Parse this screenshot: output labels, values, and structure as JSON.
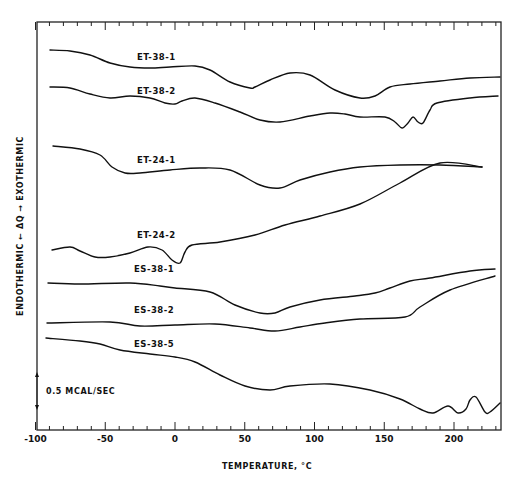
{
  "chart_data": {
    "type": "line",
    "title": "",
    "xlabel": "TEMPERATURE, °C",
    "ylabel": "ENDOTHERMIC ← ΔQ → EXOTHERMIC",
    "xlim": [
      -100,
      230
    ],
    "x_ticks": [
      -100,
      -50,
      0,
      50,
      100,
      150,
      200
    ],
    "x_minor_tick_step": 10,
    "grid": false,
    "scale_bar": {
      "label": "0.5 MCAL/SEC",
      "x": 37,
      "y1": 372,
      "y2": 410
    },
    "plot_px": {
      "left": 37,
      "right": 501,
      "top": 22,
      "bottom": 430,
      "x0_px": 175,
      "px_per_deg": 1.395
    },
    "series": [
      {
        "name": "ET-38-1",
        "label_pos": [
          137,
          60
        ],
        "points": [
          [
            50,
            50
          ],
          [
            70,
            51
          ],
          [
            90,
            55
          ],
          [
            110,
            63
          ],
          [
            130,
            67
          ],
          [
            150,
            68
          ],
          [
            170,
            67
          ],
          [
            195,
            66
          ],
          [
            210,
            70
          ],
          [
            230,
            82
          ],
          [
            250,
            88
          ],
          [
            255,
            87
          ],
          [
            270,
            80
          ],
          [
            290,
            73
          ],
          [
            310,
            75
          ],
          [
            335,
            90
          ],
          [
            360,
            98
          ],
          [
            375,
            96
          ],
          [
            390,
            87
          ],
          [
            410,
            84
          ],
          [
            440,
            81
          ],
          [
            470,
            78
          ],
          [
            500,
            77
          ]
        ]
      },
      {
        "name": "ET-38-2",
        "label_pos": [
          137,
          94
        ],
        "points": [
          [
            50,
            87
          ],
          [
            70,
            88
          ],
          [
            90,
            94
          ],
          [
            110,
            98
          ],
          [
            130,
            96
          ],
          [
            150,
            98
          ],
          [
            165,
            103
          ],
          [
            175,
            104
          ],
          [
            182,
            101
          ],
          [
            195,
            98
          ],
          [
            215,
            103
          ],
          [
            240,
            112
          ],
          [
            260,
            120
          ],
          [
            280,
            122
          ],
          [
            310,
            116
          ],
          [
            330,
            113
          ],
          [
            345,
            114
          ],
          [
            360,
            117
          ],
          [
            385,
            117
          ],
          [
            395,
            122
          ],
          [
            402,
            128
          ],
          [
            408,
            123
          ],
          [
            413,
            117
          ],
          [
            418,
            122
          ],
          [
            423,
            123
          ],
          [
            430,
            110
          ],
          [
            437,
            103
          ],
          [
            470,
            98
          ],
          [
            498,
            96
          ]
        ]
      },
      {
        "name": "ET-24-1",
        "label_pos": [
          137,
          163
        ],
        "points": [
          [
            53,
            146
          ],
          [
            80,
            149
          ],
          [
            100,
            155
          ],
          [
            112,
            167
          ],
          [
            125,
            173
          ],
          [
            140,
            173
          ],
          [
            170,
            170
          ],
          [
            200,
            168
          ],
          [
            230,
            170
          ],
          [
            260,
            185
          ],
          [
            280,
            188
          ],
          [
            300,
            180
          ],
          [
            330,
            172
          ],
          [
            360,
            167
          ],
          [
            400,
            165
          ],
          [
            440,
            165
          ],
          [
            482,
            167
          ]
        ]
      },
      {
        "name": "ET-24-2",
        "label_pos": [
          137,
          238
        ],
        "points": [
          [
            52,
            250
          ],
          [
            70,
            247
          ],
          [
            80,
            251
          ],
          [
            95,
            257
          ],
          [
            110,
            257
          ],
          [
            130,
            253
          ],
          [
            148,
            247
          ],
          [
            162,
            250
          ],
          [
            172,
            260
          ],
          [
            180,
            263
          ],
          [
            185,
            252
          ],
          [
            192,
            245
          ],
          [
            220,
            242
          ],
          [
            255,
            235
          ],
          [
            285,
            225
          ],
          [
            320,
            216
          ],
          [
            360,
            204
          ],
          [
            400,
            183
          ],
          [
            440,
            163
          ],
          [
            482,
            167
          ]
        ]
      },
      {
        "name": "ES-38-1",
        "label_pos": [
          134,
          272
        ],
        "points": [
          [
            48,
            283
          ],
          [
            80,
            284
          ],
          [
            130,
            283
          ],
          [
            160,
            286
          ],
          [
            175,
            288
          ],
          [
            210,
            292
          ],
          [
            235,
            305
          ],
          [
            260,
            313
          ],
          [
            275,
            313
          ],
          [
            290,
            307
          ],
          [
            320,
            300
          ],
          [
            355,
            296
          ],
          [
            375,
            293
          ],
          [
            390,
            288
          ],
          [
            410,
            281
          ],
          [
            430,
            278
          ],
          [
            470,
            271
          ],
          [
            495,
            269
          ]
        ]
      },
      {
        "name": "ES-38-2",
        "label_pos": [
          134,
          313
        ],
        "points": [
          [
            47,
            323
          ],
          [
            110,
            322
          ],
          [
            140,
            326
          ],
          [
            175,
            325
          ],
          [
            215,
            324
          ],
          [
            250,
            328
          ],
          [
            275,
            331
          ],
          [
            300,
            327
          ],
          [
            325,
            323
          ],
          [
            360,
            319
          ],
          [
            405,
            317
          ],
          [
            420,
            307
          ],
          [
            450,
            290
          ],
          [
            495,
            276
          ]
        ]
      },
      {
        "name": "ES-38-5",
        "label_pos": [
          134,
          347
        ],
        "points": [
          [
            46,
            338
          ],
          [
            80,
            341
          ],
          [
            100,
            344
          ],
          [
            120,
            350
          ],
          [
            150,
            354
          ],
          [
            175,
            357
          ],
          [
            195,
            362
          ],
          [
            220,
            375
          ],
          [
            245,
            386
          ],
          [
            270,
            390
          ],
          [
            290,
            386
          ],
          [
            330,
            384
          ],
          [
            370,
            390
          ],
          [
            400,
            399
          ],
          [
            420,
            409
          ],
          [
            433,
            413
          ],
          [
            448,
            406
          ],
          [
            458,
            413
          ],
          [
            466,
            409
          ],
          [
            470,
            400
          ],
          [
            476,
            397
          ],
          [
            485,
            412
          ],
          [
            490,
            412
          ],
          [
            500,
            403
          ]
        ]
      }
    ]
  }
}
